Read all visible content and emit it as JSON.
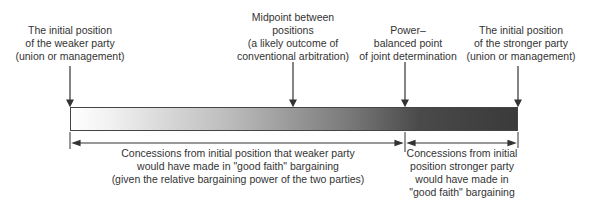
{
  "diagram": {
    "title": "",
    "bar": {
      "left_label": "weaker party initial position",
      "right_label": "stronger party initial position",
      "gradient": [
        "#ffffff",
        "#3a3a3a"
      ]
    },
    "markers": [
      {
        "id": "weaker",
        "lines": [
          "The initial position",
          "of the weaker party",
          "(union or management)"
        ]
      },
      {
        "id": "midpoint",
        "lines": [
          "Midpoint between",
          "positions",
          "(a likely outcome of",
          "conventional arbitration)"
        ]
      },
      {
        "id": "balanced",
        "lines": [
          "Power–",
          "balanced point",
          "of joint determination"
        ]
      },
      {
        "id": "stronger",
        "lines": [
          "The initial position",
          "of the stronger party",
          "(union or management)"
        ]
      }
    ],
    "ranges": [
      {
        "id": "weaker-concessions",
        "lines": [
          "Concessions from initial position that weaker party",
          "would have made in \"good faith\"  bargaining",
          "(given the relative bargaining power of the two parties)"
        ]
      },
      {
        "id": "stronger-concessions",
        "lines": [
          "Concessions from initial",
          "position stronger party",
          "would have made in",
          "\"good faith\"  bargaining"
        ]
      }
    ]
  }
}
